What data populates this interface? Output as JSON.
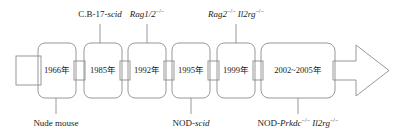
{
  "diagram": {
    "orientation": "left-to-right-arrow",
    "stroke_color": "#808080",
    "text_color": "#1a1a1a",
    "background_color": "#ffffff"
  },
  "boxes": [
    {
      "id": "box-1966",
      "year": "1966年"
    },
    {
      "id": "box-1985",
      "year": "1985年"
    },
    {
      "id": "box-1992",
      "year": "1992年"
    },
    {
      "id": "box-1995",
      "year": "1995年"
    },
    {
      "id": "box-1999",
      "year": "1999年"
    },
    {
      "id": "box-2002-2005",
      "year": "2002~2005年"
    }
  ],
  "labels_above": [
    {
      "id": "label-cb17-scid",
      "plain": "C.B-17-",
      "italic": "scid",
      "sup": ""
    },
    {
      "id": "label-rag12",
      "plain": "",
      "italic": "Rag1/2",
      "sup": "−/−"
    },
    {
      "id": "label-rag2-il2rg",
      "plain": "",
      "italic": "Rag2",
      "sup": "−/−",
      "italic2": "Il2rg",
      "sup2": "−/−"
    }
  ],
  "labels_below": [
    {
      "id": "label-nude-mouse",
      "plain": "Nude mouse",
      "italic": "",
      "sup": ""
    },
    {
      "id": "label-nod-scid",
      "plain": "NOD-",
      "italic": "scid",
      "sup": ""
    },
    {
      "id": "label-nod-prkdc-il2rg",
      "plain": "NOD-",
      "italic": "Prkdc",
      "sup": "−/−",
      "italic2": "Il2rg",
      "sup2": "−/−"
    }
  ]
}
